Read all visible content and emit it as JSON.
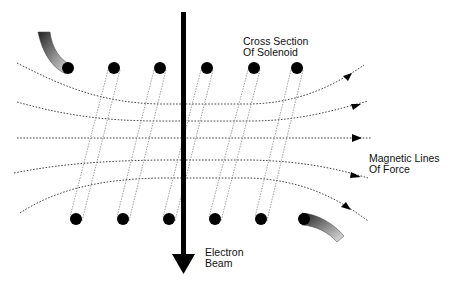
{
  "diagram": {
    "labels": {
      "cross_section_line1": "Cross Section",
      "cross_section_line2": "Of Solenoid",
      "field_line1": "Magnetic Lines",
      "field_line2": "Of Force",
      "beam_line1": "Electron",
      "beam_line2": "Beam"
    },
    "colors": {
      "ink": "#000000",
      "wire": "#777777",
      "field": "#333333",
      "background": "#ffffff"
    },
    "solenoid": {
      "top_conductors_x": [
        68,
        114,
        160,
        207,
        254,
        297
      ],
      "top_conductors_y": 68,
      "bottom_conductors_x": [
        76,
        123,
        169,
        215,
        261,
        304
      ],
      "bottom_conductors_y": 219,
      "conductor_radius": 6
    },
    "field_lines_count": 5,
    "beam_direction": "down"
  }
}
